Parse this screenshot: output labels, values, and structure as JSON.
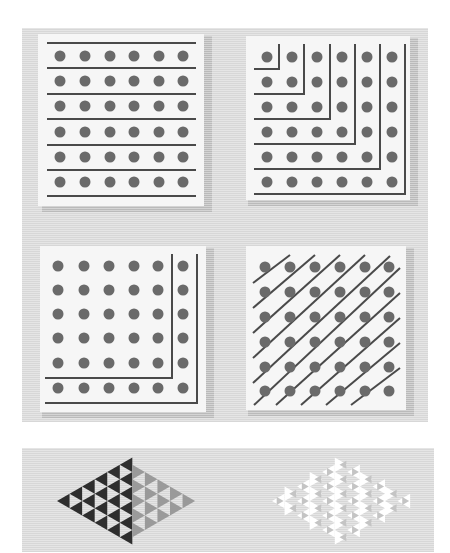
{
  "figure": {
    "colors": {
      "background": "#e4e4e4",
      "panel": "#f6f6f6",
      "dot": "#6a6a6a",
      "line": "#4a4a4a",
      "triangle_dark": "#2e2e2e",
      "triangle_mid": "#9a9a9a",
      "triangle_light": "#c8c8c8"
    },
    "panels": [
      {
        "id": "rows",
        "label": "rows",
        "grid": [
          6,
          6
        ],
        "partition": "horizontal lines separating 6 rows of 6",
        "sum": "6+6+6+6+6+6 = 36"
      },
      {
        "id": "gnomons",
        "label": "nested L-shapes",
        "grid": [
          6,
          6
        ],
        "partition": "nested L-shaped gnomons",
        "sum": "1+3+5+7+9+11 = 36"
      },
      {
        "id": "corner",
        "label": "single L corner",
        "grid": [
          6,
          6
        ],
        "partition": "two L-shaped separators around the outer corner",
        "sum": "25+11 = 36"
      },
      {
        "id": "diagonals",
        "label": "diagonals",
        "grid": [
          6,
          6
        ],
        "partition": "diagonal lines",
        "sum": "1+2+3+4+5+6+5+4+3+2+1 = 36"
      }
    ],
    "bottom_strip": {
      "left_pattern": "dark triangular arrangement with gray triangles",
      "right_pattern": "light triangular arrangement"
    }
  }
}
